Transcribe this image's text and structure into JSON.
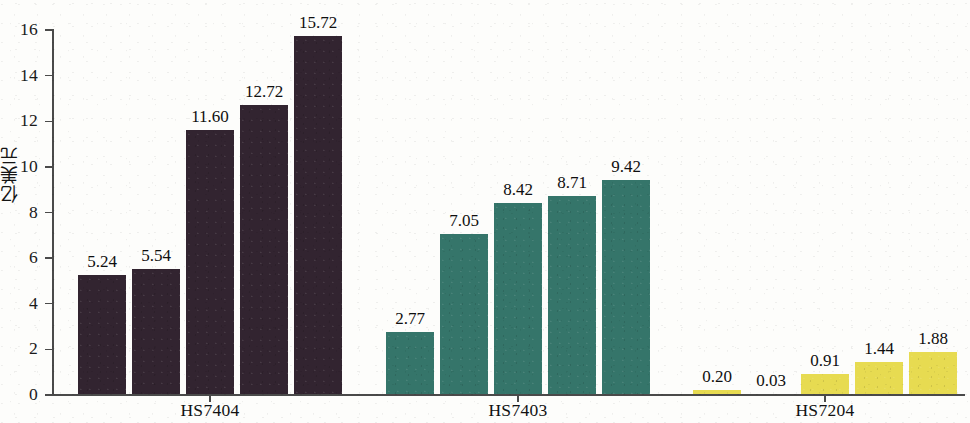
{
  "chart_data": {
    "type": "bar",
    "title": "",
    "subtitle": "",
    "xlabel": "",
    "ylabel": "亿美元",
    "ylim": [
      0,
      16
    ],
    "ytick_values": [
      0,
      2,
      4,
      6,
      8,
      10,
      12,
      14,
      16
    ],
    "ytick_labels": [
      "0",
      "2",
      "4",
      "6",
      "8",
      "10",
      "12",
      "14",
      "16"
    ],
    "grid": false,
    "legend": false,
    "legend_position": "none",
    "categories": [
      "HS7404",
      "HS7403",
      "HS7204"
    ],
    "group_colors": [
      "#32243033",
      "#35756a",
      "#e7db51"
    ],
    "groups": [
      {
        "name": "HS7404",
        "color": "#322430",
        "values": [
          5.24,
          5.54,
          11.6,
          12.72,
          15.72
        ],
        "labels": [
          "5.24",
          "5.54",
          "11.60",
          "12.72",
          "15.72"
        ]
      },
      {
        "name": "HS7403",
        "color": "#35756a",
        "values": [
          2.77,
          7.05,
          8.42,
          8.71,
          9.42
        ],
        "labels": [
          "2.77",
          "7.05",
          "8.42",
          "8.71",
          "9.42"
        ]
      },
      {
        "name": "HS7204",
        "color": "#e7db51",
        "values": [
          0.2,
          0.03,
          0.91,
          1.44,
          1.88
        ],
        "labels": [
          "0.20",
          "0.03",
          "0.91",
          "1.44",
          "1.88"
        ]
      }
    ],
    "values_flat": [
      5.24,
      5.54,
      11.6,
      12.72,
      15.72,
      2.77,
      7.05,
      8.42,
      8.71,
      9.42,
      0.2,
      0.03,
      0.91,
      1.44,
      1.88
    ]
  },
  "axis": {
    "y_title": "亿美元",
    "ticks": [
      "0",
      "2",
      "4",
      "6",
      "8",
      "10",
      "12",
      "14",
      "16"
    ]
  },
  "groups": {
    "g0": {
      "label": "HS7404"
    },
    "g1": {
      "label": "HS7403"
    },
    "g2": {
      "label": "HS7204"
    }
  },
  "bar_labels": {
    "b0": "5.24",
    "b1": "5.54",
    "b2": "11.60",
    "b3": "12.72",
    "b4": "15.72",
    "b5": "2.77",
    "b6": "7.05",
    "b7": "8.42",
    "b8": "8.71",
    "b9": "9.42",
    "b10": "0.20",
    "b11": "0.03",
    "b12": "0.91",
    "b13": "1.44",
    "b14": "1.88"
  }
}
